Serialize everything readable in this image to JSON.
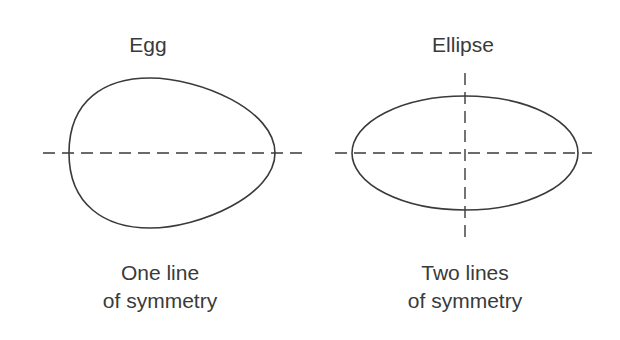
{
  "figures": [
    {
      "title": "Egg",
      "caption_line1": "One line",
      "caption_line2": "of symmetry",
      "lines_of_symmetry": 1
    },
    {
      "title": "Ellipse",
      "caption_line1": "Two lines",
      "caption_line2": "of symmetry",
      "lines_of_symmetry": 2
    }
  ],
  "colors": {
    "stroke": "#3a3a3a",
    "text": "#3a3a3a",
    "background": "#ffffff"
  }
}
